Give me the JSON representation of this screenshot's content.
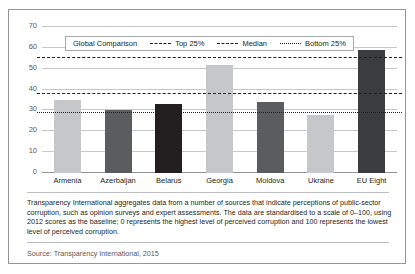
{
  "top_sliver_text": "",
  "legend": {
    "title": "Global Comparison",
    "items": [
      {
        "label": "Top 25%",
        "style": "dashed"
      },
      {
        "label": "Median",
        "style": "dashed"
      },
      {
        "label": "Bottom 25%",
        "style": "dotted"
      }
    ]
  },
  "note": "Transparency International aggregates data from a number of sources that indicate perceptions of public-sector corruption, such as opinion surveys and expert assessments. The data are standardised to a scale of 0–100, using 2012 scores as the baseline; 0 represents the highest level of perceived corruption and 100 represents the lowest level of perceived corruption.",
  "source": "Source: Transparency International, 2015",
  "chart_data": {
    "type": "bar",
    "title": "",
    "subtitle": "",
    "xlabel": "",
    "ylabel": "",
    "categories": [
      "Armenia",
      "Azerbaijan",
      "Belarus",
      "Georgia",
      "Moldova",
      "Ukraine",
      "EU Eight"
    ],
    "values": [
      35,
      30,
      33,
      52,
      34,
      28,
      59
    ],
    "bar_colors": [
      "#c6c7c9",
      "#5a5c5e",
      "#231f20",
      "#c6c7c9",
      "#5a5c5e",
      "#c6c7c9",
      "#3b3c3e"
    ],
    "ylim": [
      0,
      70
    ],
    "yticks": [
      0,
      10,
      20,
      30,
      40,
      50,
      60,
      70
    ],
    "grid": true,
    "legend_position": "top-inside",
    "reference_lines": [
      {
        "name": "Top 25%",
        "value": 55,
        "style": "dashed"
      },
      {
        "name": "Median",
        "value": 38,
        "style": "dashed"
      },
      {
        "name": "Bottom 25%",
        "value": 29,
        "style": "dotted"
      }
    ]
  }
}
